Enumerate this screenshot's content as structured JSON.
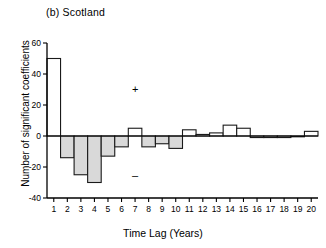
{
  "figure": {
    "panel_label": "(b)  Scotland",
    "xlabel": "Time Lag (Years)",
    "ylabel": "Number of significant coefficients",
    "plus_mark": "+",
    "minus_mark": "–"
  },
  "colors": {
    "axis": "#000000",
    "bar_stroke": "#1a1a1a",
    "bar_fill_negative": "#d9d9d9",
    "bar_fill_positive": "#ffffff",
    "background": "#ffffff"
  },
  "chart_data": {
    "type": "bar",
    "title": "(b)  Scotland",
    "xlabel": "Time Lag (Years)",
    "ylabel": "Number of significant coefficients",
    "xlim": [
      0.5,
      20.5
    ],
    "ylim": [
      -40,
      60
    ],
    "yticks": [
      -40,
      -20,
      0,
      20,
      40,
      60
    ],
    "ytick_labels": [
      "-40",
      "-20",
      "0",
      "20",
      "40",
      "60"
    ],
    "xticks": [
      1,
      2,
      3,
      4,
      5,
      6,
      7,
      8,
      9,
      10,
      11,
      12,
      13,
      14,
      15,
      16,
      17,
      18,
      19,
      20
    ],
    "xtick_labels": [
      "1",
      "2",
      "3",
      "4",
      "5",
      "6",
      "7",
      "8",
      "9",
      "10",
      "11",
      "12",
      "13",
      "14",
      "15",
      "16",
      "17",
      "18",
      "19",
      "20"
    ],
    "grid": false,
    "legend": null,
    "categories": [
      1,
      2,
      3,
      4,
      5,
      6,
      7,
      8,
      9,
      10,
      11,
      12,
      13,
      14,
      15,
      16,
      17,
      18,
      19,
      20
    ],
    "values": [
      50,
      -14,
      -25,
      -30,
      -13,
      -7,
      5,
      -7,
      -5,
      -8,
      4,
      1,
      2,
      7,
      5,
      -1,
      -1,
      -1,
      0,
      3
    ],
    "annotations": [
      {
        "text": "+",
        "x": 7,
        "y": 30
      },
      {
        "text": "–",
        "x": 7,
        "y": -26
      }
    ]
  }
}
